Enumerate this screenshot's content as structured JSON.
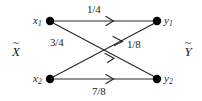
{
  "figure": {
    "type": "channel-transition-diagram",
    "side_labels": {
      "input": {
        "accent": "~",
        "symbol": "X"
      },
      "output": {
        "accent": "~",
        "symbol": "Y"
      }
    },
    "input_nodes": [
      {
        "id": "x1",
        "base": "x",
        "sub": "1"
      },
      {
        "id": "x2",
        "base": "x",
        "sub": "2"
      }
    ],
    "output_nodes": [
      {
        "id": "y1",
        "base": "y",
        "sub": "1"
      },
      {
        "id": "y2",
        "base": "y",
        "sub": "2"
      }
    ],
    "edges": [
      {
        "id": "x1-y1",
        "from": "x1",
        "to": "y1",
        "label": "1/4"
      },
      {
        "id": "x1-y2",
        "from": "x1",
        "to": "y2",
        "label": "3/4"
      },
      {
        "id": "x2-y1",
        "from": "x2",
        "to": "y1",
        "label": "1/8"
      },
      {
        "id": "x2-y2",
        "from": "x2",
        "to": "y2",
        "label": "7/8"
      }
    ],
    "colors": {
      "line": "#2b2b2b",
      "node": "#000000",
      "text": "#1a1a1a",
      "background": "#ffffff"
    }
  }
}
